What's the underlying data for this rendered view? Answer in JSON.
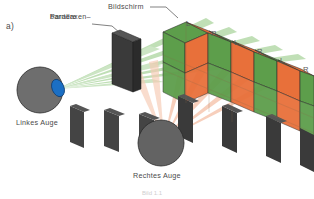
{
  "figure": {
    "panel_label": "a)",
    "labels": {
      "screen": "Bildschirm",
      "barrier_line1": "Parallaxen–",
      "barrier_line2": "barriere",
      "left_eye": "Linkes Auge",
      "right_eye": "Rechtes Auge",
      "bottom_caption": "Bild 1.1"
    },
    "strip_markers": [
      {
        "label": "L",
        "x": 186,
        "y": 20
      },
      {
        "label": "R",
        "x": 211,
        "y": 30
      },
      {
        "label": "L",
        "x": 234,
        "y": 39
      },
      {
        "label": "R",
        "x": 257,
        "y": 48
      },
      {
        "label": "L",
        "x": 280,
        "y": 57
      },
      {
        "label": "R",
        "x": 303,
        "y": 66
      }
    ],
    "colors": {
      "left_view_green": "#5d9e4b",
      "right_view_orange": "#e8703a",
      "green_beam": "#a8d49a",
      "orange_beam": "#f3b79a",
      "eye_body": "#6e6e6e",
      "iris_blue": "#1b6fc4",
      "barrier_dark": "#3a3a3a",
      "outline": "#2a2a2a",
      "text_gray": "#4a4a4a"
    }
  }
}
